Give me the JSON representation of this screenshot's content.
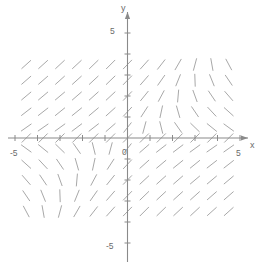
{
  "figure": {
    "background_color": "#ffffff",
    "axis_color": "#8a8a8a",
    "slope_mark_color": "#a8a8a8",
    "label_color": "#6b6b6b"
  },
  "axes": {
    "x_axis_label": "x",
    "y_axis_label": "y",
    "origin_label": "0",
    "x_min_label": "-5",
    "x_max_label": "5",
    "y_min_label": "-5",
    "y_max_label": "5"
  },
  "chart_data": {
    "type": "scatter",
    "subtype": "slope-field",
    "title": "",
    "xlabel": "x",
    "ylabel": "y",
    "xlim": [
      -5,
      5
    ],
    "ylim": [
      -5,
      5
    ],
    "xticks": [
      -5,
      -4,
      -3,
      -2,
      -1,
      0,
      1,
      2,
      3,
      4,
      5
    ],
    "yticks": [
      -5,
      -4,
      -3,
      -2,
      -1,
      0,
      1,
      2,
      3,
      4,
      5
    ],
    "xtick_labels": [
      "-5",
      "",
      "",
      "",
      "",
      "0",
      "",
      "",
      "",
      "",
      "5"
    ],
    "ytick_labels": [
      "-5",
      "",
      "",
      "",
      "",
      "0",
      "",
      "",
      "",
      "",
      "5"
    ],
    "grid": false,
    "legend": null,
    "grid_x": [
      -4.5,
      -3.75,
      -3.0,
      -2.25,
      -1.5,
      -0.75,
      0.0,
      0.75,
      1.5,
      2.25,
      3.0,
      3.75,
      4.5
    ],
    "grid_y": [
      3.5,
      2.75,
      2.0,
      1.25,
      0.5,
      0.0,
      -0.5,
      -1.25,
      -2.0,
      -2.75,
      -3.5
    ],
    "mark_length": 12,
    "slope_formula": "dy/dx = (x + y) / (x - y)",
    "angles_deg": [
      [
        42,
        42,
        43,
        43,
        44,
        45,
        46,
        48,
        52,
        60,
        75,
        100,
        118
      ],
      [
        41,
        41,
        42,
        42,
        43,
        44,
        46,
        49,
        55,
        68,
        92,
        112,
        124
      ],
      [
        40,
        40,
        40,
        41,
        42,
        43,
        46,
        51,
        62,
        85,
        110,
        124,
        131
      ],
      [
        38,
        38,
        39,
        39,
        40,
        42,
        47,
        57,
        78,
        106,
        124,
        133,
        138
      ],
      [
        35,
        35,
        36,
        37,
        38,
        41,
        52,
        75,
        104,
        125,
        136,
        141,
        144
      ],
      [
        45,
        45,
        45,
        45,
        45,
        45,
        45,
        45,
        45,
        45,
        45,
        45,
        45
      ],
      [
        144,
        141,
        136,
        125,
        104,
        75,
        52,
        41,
        38,
        37,
        36,
        35,
        35
      ],
      [
        138,
        133,
        124,
        106,
        78,
        57,
        47,
        42,
        40,
        39,
        39,
        38,
        38
      ],
      [
        131,
        124,
        110,
        85,
        62,
        51,
        46,
        43,
        42,
        41,
        40,
        40,
        40
      ],
      [
        124,
        112,
        92,
        68,
        55,
        49,
        46,
        44,
        43,
        42,
        42,
        41,
        41
      ],
      [
        118,
        100,
        75,
        60,
        52,
        48,
        46,
        45,
        44,
        43,
        43,
        42,
        42
      ]
    ]
  }
}
